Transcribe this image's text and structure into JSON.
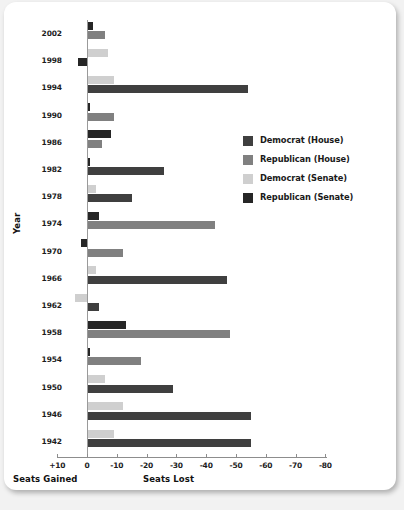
{
  "chart_data": {
    "type": "bar",
    "orientation": "horizontal",
    "title": "",
    "xlabel_left": "Seats Gained",
    "xlabel_right": "Seats Lost",
    "ylabel": "Year",
    "xticks": [
      "+10",
      "0",
      "-10",
      "-20",
      "-30",
      "-40",
      "-50",
      "-60",
      "-70",
      "-80"
    ],
    "xtick_values": [
      10,
      0,
      -10,
      -20,
      -30,
      -40,
      -50,
      -60,
      -70,
      -80
    ],
    "xlim": [
      10,
      -80
    ],
    "grid": false,
    "legend_position": "right-middle",
    "categories": [
      "2002",
      "1998",
      "1994",
      "1990",
      "1986",
      "1982",
      "1978",
      "1974",
      "1970",
      "1966",
      "1962",
      "1958",
      "1954",
      "1950",
      "1946",
      "1942"
    ],
    "series": [
      {
        "name": "Democrat (House)",
        "color": "#3f3f3f",
        "values": [
          null,
          null,
          -54,
          null,
          null,
          -26,
          -15,
          null,
          null,
          -47,
          -4,
          null,
          null,
          -29,
          -55,
          -55
        ]
      },
      {
        "name": "Republican (House)",
        "color": "#808080",
        "values": [
          -6,
          null,
          null,
          -9,
          -5,
          null,
          null,
          -43,
          -12,
          null,
          null,
          -48,
          -18,
          null,
          null,
          null
        ]
      },
      {
        "name": "Democrat (Senate)",
        "color": "#cfcfcf",
        "values": [
          null,
          -7,
          -9,
          null,
          null,
          null,
          -3,
          null,
          null,
          -3,
          4,
          null,
          null,
          -6,
          -12,
          -9
        ]
      },
      {
        "name": "Republican (Senate)",
        "color": "#262626",
        "values": [
          -2,
          3,
          null,
          -1,
          -8,
          -1,
          null,
          -4,
          2,
          null,
          null,
          -13,
          -1,
          null,
          null,
          null
        ]
      }
    ],
    "rows": [
      {
        "year": "2002",
        "bars": [
          {
            "series": "Republican (Senate)",
            "value": -2
          },
          {
            "series": "Republican (House)",
            "value": -6
          }
        ]
      },
      {
        "year": "1998",
        "bars": [
          {
            "series": "Democrat (Senate)",
            "value": -7
          },
          {
            "series": "Republican (Senate)",
            "value": 3
          }
        ]
      },
      {
        "year": "1994",
        "bars": [
          {
            "series": "Democrat (Senate)",
            "value": -9
          },
          {
            "series": "Democrat (House)",
            "value": -54
          }
        ]
      },
      {
        "year": "1990",
        "bars": [
          {
            "series": "Republican (Senate)",
            "value": -1
          },
          {
            "series": "Republican (House)",
            "value": -9
          }
        ]
      },
      {
        "year": "1986",
        "bars": [
          {
            "series": "Republican (Senate)",
            "value": -8
          },
          {
            "series": "Republican (House)",
            "value": -5
          }
        ]
      },
      {
        "year": "1982",
        "bars": [
          {
            "series": "Republican (Senate)",
            "value": -1
          },
          {
            "series": "Democrat (House)",
            "value": -26
          }
        ]
      },
      {
        "year": "1978",
        "bars": [
          {
            "series": "Democrat (Senate)",
            "value": -3
          },
          {
            "series": "Democrat (House)",
            "value": -15
          }
        ]
      },
      {
        "year": "1974",
        "bars": [
          {
            "series": "Republican (Senate)",
            "value": -4
          },
          {
            "series": "Republican (House)",
            "value": -43
          }
        ]
      },
      {
        "year": "1970",
        "bars": [
          {
            "series": "Republican (Senate)",
            "value": 2
          },
          {
            "series": "Republican (House)",
            "value": -12
          }
        ]
      },
      {
        "year": "1966",
        "bars": [
          {
            "series": "Democrat (Senate)",
            "value": -3
          },
          {
            "series": "Democrat (House)",
            "value": -47
          }
        ]
      },
      {
        "year": "1962",
        "bars": [
          {
            "series": "Democrat (Senate)",
            "value": 4
          },
          {
            "series": "Democrat (House)",
            "value": -4
          }
        ]
      },
      {
        "year": "1958",
        "bars": [
          {
            "series": "Republican (Senate)",
            "value": -13
          },
          {
            "series": "Republican (House)",
            "value": -48
          }
        ]
      },
      {
        "year": "1954",
        "bars": [
          {
            "series": "Republican (Senate)",
            "value": -1
          },
          {
            "series": "Republican (House)",
            "value": -18
          }
        ]
      },
      {
        "year": "1950",
        "bars": [
          {
            "series": "Democrat (Senate)",
            "value": -6
          },
          {
            "series": "Democrat (House)",
            "value": -29
          }
        ]
      },
      {
        "year": "1946",
        "bars": [
          {
            "series": "Democrat (Senate)",
            "value": -12
          },
          {
            "series": "Democrat (House)",
            "value": -55
          }
        ]
      },
      {
        "year": "1942",
        "bars": [
          {
            "series": "Democrat (Senate)",
            "value": -9
          },
          {
            "series": "Democrat (House)",
            "value": -55
          }
        ]
      }
    ]
  },
  "legend": {
    "items": [
      {
        "label": "Democrat (House)",
        "color": "#3f3f3f"
      },
      {
        "label": "Republican (House)",
        "color": "#808080"
      },
      {
        "label": "Democrat (Senate)",
        "color": "#cfcfcf"
      },
      {
        "label": "Republican (Senate)",
        "color": "#262626"
      }
    ]
  },
  "axes": {
    "y_title": "Year",
    "x_left_caption": "Seats Gained",
    "x_right_caption": "Seats Lost"
  }
}
